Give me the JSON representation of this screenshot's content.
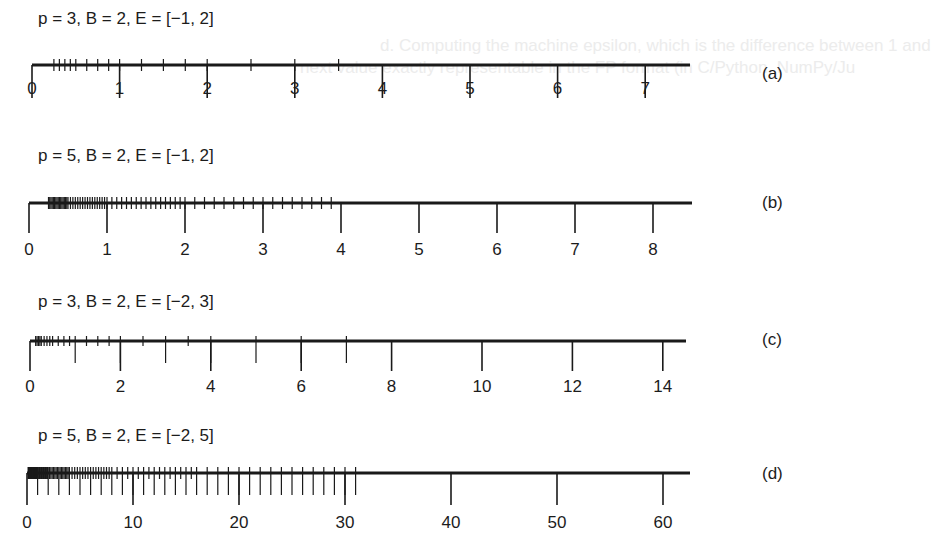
{
  "chart_data": [
    {
      "type": "number-line",
      "id": "a",
      "title": "p = 3, B = 2, E = [−1, 2]",
      "tag": "(a)",
      "params": {
        "p": 3,
        "B": 2,
        "E": [
          -1,
          2
        ]
      },
      "tick_labels": [
        "0",
        "1",
        "2",
        "3",
        "4",
        "5",
        "6",
        "7"
      ],
      "tick_values": [
        0,
        1,
        2,
        3,
        4,
        5,
        6,
        7
      ],
      "xlim": [
        0,
        7.5
      ],
      "representable_values": [
        0.5,
        0.625,
        0.75,
        0.875,
        1,
        1.25,
        1.5,
        1.75,
        2,
        2.5,
        3,
        3.5,
        4,
        5,
        6,
        7
      ]
    },
    {
      "type": "number-line",
      "id": "b",
      "title": "p = 5, B = 2, E = [−1, 2]",
      "tag": "(b)",
      "params": {
        "p": 5,
        "B": 2,
        "E": [
          -1,
          2
        ]
      },
      "tick_labels": [
        "0",
        "1",
        "2",
        "3",
        "4",
        "5",
        "6",
        "7",
        "8"
      ],
      "tick_values": [
        0,
        1,
        2,
        3,
        4,
        5,
        6,
        7,
        8
      ],
      "xlim": [
        0,
        8.5
      ],
      "representable_values_description": "mantissa step 2^-4 per binade: [0.5,1) step 1/32, [1,2) step 1/16, [2,4) step 1/8, [4,8) step 1/4, max 7.75"
    },
    {
      "type": "number-line",
      "id": "c",
      "title": "p = 3, B = 2, E = [−2, 3]",
      "tag": "(c)",
      "params": {
        "p": 3,
        "B": 2,
        "E": [
          -2,
          3
        ]
      },
      "tick_labels": [
        "0",
        "2",
        "4",
        "6",
        "8",
        "10",
        "12",
        "14"
      ],
      "tick_values": [
        0,
        2,
        4,
        6,
        8,
        10,
        12,
        14
      ],
      "xlim": [
        0,
        14.5
      ],
      "representable_values": [
        0.25,
        0.3125,
        0.375,
        0.4375,
        0.5,
        0.625,
        0.75,
        0.875,
        1,
        1.25,
        1.5,
        1.75,
        2,
        2.5,
        3,
        3.5,
        4,
        5,
        6,
        7,
        8,
        10,
        12,
        14
      ]
    },
    {
      "type": "number-line",
      "id": "d",
      "title": "p = 5, B = 2, E = [−2, 5]",
      "tag": "(d)",
      "params": {
        "p": 5,
        "B": 2,
        "E": [
          -2,
          5
        ]
      },
      "tick_labels": [
        "0",
        "10",
        "20",
        "30",
        "40",
        "50",
        "60"
      ],
      "tick_values": [
        0,
        10,
        20,
        30,
        40,
        50,
        60
      ],
      "xlim": [
        0,
        63
      ],
      "representable_values_description": "16 values per binade from 0.25 up to 62, step 2 in [32,64)"
    }
  ],
  "background_bleedthrough": {
    "line1": "d. Computing the machine epsilon, which is the difference between 1 and",
    "line2": "next value exactly representable in the FP format (in C/Python, NumPy/Ju"
  }
}
